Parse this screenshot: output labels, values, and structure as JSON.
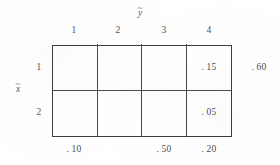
{
  "figure": {
    "type": "joint-probability-table",
    "row_variable": "x",
    "row_variable_accent": "~",
    "column_variable": "y",
    "column_variable_accent": "~",
    "column_headers": [
      "1",
      "2",
      "3",
      "4"
    ],
    "row_headers": [
      "1",
      "2"
    ],
    "cells": [
      {
        "row": "1",
        "column": "1",
        "value": ""
      },
      {
        "row": "1",
        "column": "2",
        "value": ""
      },
      {
        "row": "1",
        "column": "3",
        "value": ""
      },
      {
        "row": "1",
        "column": "4",
        "value": ". 15"
      },
      {
        "row": "2",
        "column": "1",
        "value": ""
      },
      {
        "row": "2",
        "column": "2",
        "value": ""
      },
      {
        "row": "2",
        "column": "3",
        "value": ""
      },
      {
        "row": "2",
        "column": "4",
        "value": ". 05"
      }
    ],
    "row_margins": [
      {
        "row": "1",
        "value": ". 60"
      },
      {
        "row": "2",
        "value": ""
      }
    ],
    "column_margins": [
      {
        "column": "1",
        "value": ". 10"
      },
      {
        "column": "2",
        "value": ""
      },
      {
        "column": "3",
        "value": ". 50"
      },
      {
        "column": "4",
        "value": ". 20"
      }
    ]
  }
}
